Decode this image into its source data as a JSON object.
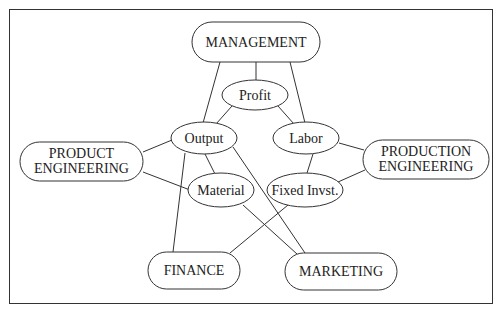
{
  "diagram": {
    "departments": [
      {
        "id": "management",
        "label": "MANAGEMENT",
        "x": 192,
        "y": 22,
        "w": 128,
        "h": 40
      },
      {
        "id": "product-engineering",
        "label_lines": [
          "PRODUCT",
          "ENGINEERING"
        ],
        "x": 20,
        "y": 142,
        "w": 123,
        "h": 39
      },
      {
        "id": "production-engineering",
        "label_lines": [
          "PRODUCTION",
          "ENGINEERING"
        ],
        "x": 363,
        "y": 140,
        "w": 126,
        "h": 39
      },
      {
        "id": "finance",
        "label": "FINANCE",
        "x": 148,
        "y": 252,
        "w": 92,
        "h": 37
      },
      {
        "id": "marketing",
        "label": "MARKETING",
        "x": 285,
        "y": 253,
        "w": 112,
        "h": 37
      }
    ],
    "factors": [
      {
        "id": "profit",
        "label": "Profit",
        "cx": 255,
        "cy": 95,
        "rx": 33,
        "ry": 15
      },
      {
        "id": "output",
        "label": "Output",
        "cx": 204,
        "cy": 138,
        "rx": 33,
        "ry": 16
      },
      {
        "id": "labor",
        "label": "Labor",
        "cx": 306,
        "cy": 138,
        "rx": 33,
        "ry": 16
      },
      {
        "id": "material",
        "label": "Material",
        "cx": 221,
        "cy": 190,
        "rx": 33,
        "ry": 17
      },
      {
        "id": "fixed-invst",
        "label": "Fixed Invst.",
        "cx": 305,
        "cy": 190,
        "rx": 38,
        "ry": 17
      }
    ],
    "edges": [
      {
        "from": "management",
        "to": "output",
        "x1": 220,
        "y1": 62,
        "x2": 203,
        "y2": 123
      },
      {
        "from": "management",
        "to": "profit",
        "x1": 256,
        "y1": 62,
        "x2": 256,
        "y2": 80
      },
      {
        "from": "management",
        "to": "labor",
        "x1": 290,
        "y1": 62,
        "x2": 305,
        "y2": 123
      },
      {
        "from": "profit",
        "to": "output",
        "x1": 232,
        "y1": 106,
        "x2": 216,
        "y2": 124
      },
      {
        "from": "profit",
        "to": "labor",
        "x1": 278,
        "y1": 106,
        "x2": 294,
        "y2": 124
      },
      {
        "from": "product-engineering",
        "to": "output",
        "x1": 143,
        "y1": 152,
        "x2": 172,
        "y2": 140
      },
      {
        "from": "product-engineering",
        "to": "material",
        "x1": 143,
        "y1": 172,
        "x2": 190,
        "y2": 190
      },
      {
        "from": "output",
        "to": "material",
        "x1": 205,
        "y1": 154,
        "x2": 215,
        "y2": 174
      },
      {
        "from": "output",
        "to": "finance",
        "x1": 185,
        "y1": 153,
        "x2": 173,
        "y2": 252
      },
      {
        "from": "output",
        "to": "marketing",
        "x1": 233,
        "y1": 147,
        "x2": 305,
        "y2": 253
      },
      {
        "from": "material",
        "to": "marketing",
        "x1": 243,
        "y1": 205,
        "x2": 297,
        "y2": 254
      },
      {
        "from": "labor",
        "to": "production-engineering",
        "x1": 339,
        "y1": 143,
        "x2": 364,
        "y2": 150
      },
      {
        "from": "labor",
        "to": "fixed-invst",
        "x1": 313,
        "y1": 154,
        "x2": 307,
        "y2": 173
      },
      {
        "from": "fixed-invst",
        "to": "production-engineering",
        "x1": 338,
        "y1": 182,
        "x2": 365,
        "y2": 170
      },
      {
        "from": "fixed-invst",
        "to": "finance",
        "x1": 288,
        "y1": 205,
        "x2": 230,
        "y2": 253
      }
    ]
  },
  "labels": {
    "management": "MANAGEMENT",
    "product_engineering_1": "PRODUCT",
    "product_engineering_2": "ENGINEERING",
    "production_engineering_1": "PRODUCTION",
    "production_engineering_2": "ENGINEERING",
    "finance": "FINANCE",
    "marketing": "MARKETING",
    "profit": "Profit",
    "output": "Output",
    "labor": "Labor",
    "material": "Material",
    "fixed_invst": "Fixed Invst."
  }
}
